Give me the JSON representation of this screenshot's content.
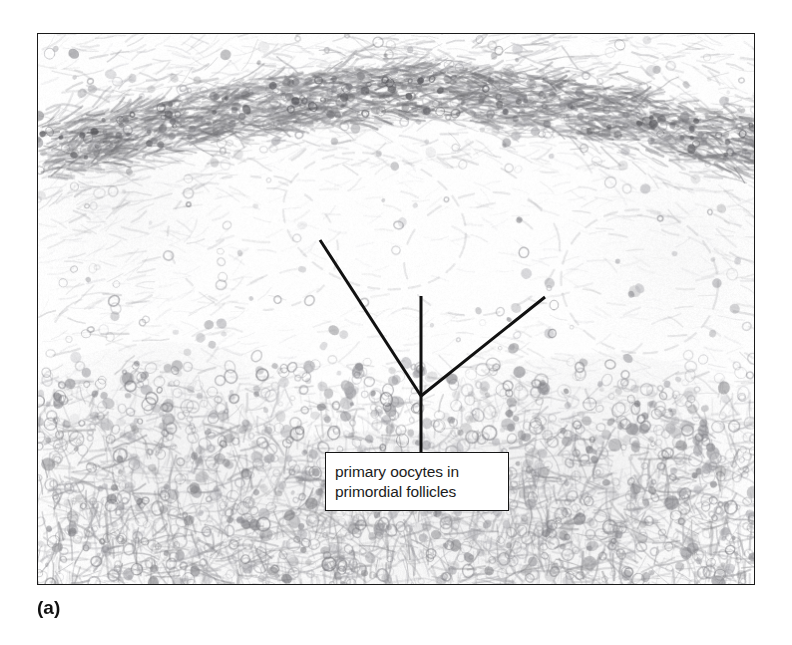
{
  "figure": {
    "panel_label": "(a)",
    "kind": "light-micrograph"
  },
  "callout": {
    "line1": "primary oocytes in",
    "line2": "primordial follicles",
    "box": {
      "x": 325,
      "y": 452,
      "width": 184,
      "height": 59
    },
    "border_color": "#161616",
    "background_color": "#ffffff",
    "text_color": "#1c1c1c"
  },
  "leader_lines": {
    "vertex": {
      "x": 421,
      "y": 396
    },
    "stem_end": {
      "x": 421,
      "y": 452
    },
    "branches": [
      {
        "name": "left-branch",
        "x": 320,
        "y": 240
      },
      {
        "name": "center-branch",
        "x": 421,
        "y": 296
      },
      {
        "name": "right-branch",
        "x": 545,
        "y": 297
      }
    ],
    "color": "#111111",
    "width": 3
  },
  "plate": {
    "x": 37,
    "y": 33,
    "width": 718,
    "height": 552,
    "border_color": "#1a1a1a",
    "background_color": "#fdfdfd"
  },
  "page": {
    "background_color": "#ffffff",
    "width": 792,
    "height": 645
  }
}
